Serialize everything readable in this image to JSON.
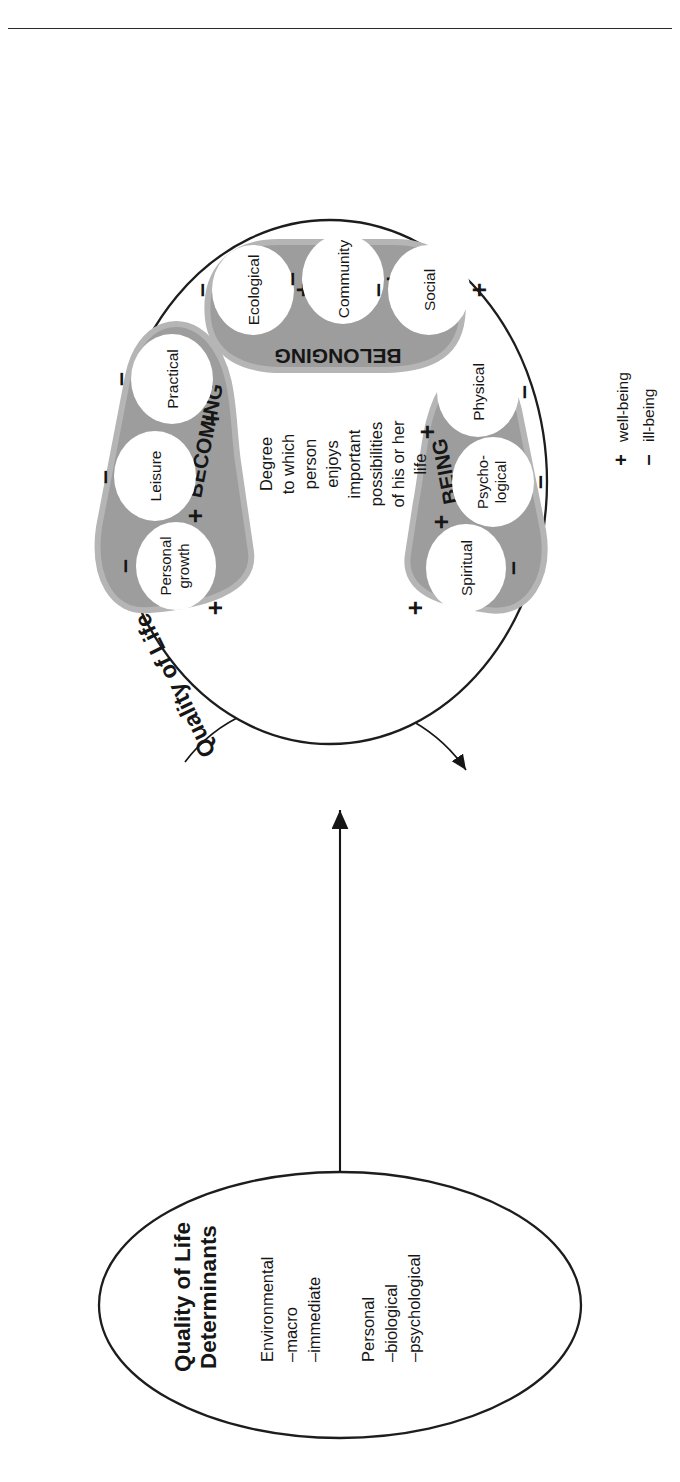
{
  "figure": {
    "rule_present": true,
    "qol_circle": {
      "title": "Quality of Life",
      "center_text": [
        "Degree",
        "to which",
        "person",
        "enjoys",
        "important",
        "possibilities",
        "of his or her",
        "life"
      ],
      "center_text_joined": "Degree to which person enjoys important possibilities of his or her life",
      "domains": [
        {
          "name": "BEING",
          "subdomains": [
            {
              "label": "Physical",
              "well_being": "+",
              "ill_being": "–"
            },
            {
              "label": "Psycho-logical",
              "label_lines": [
                "Psycho-",
                "logical"
              ],
              "well_being": "+",
              "ill_being": "–"
            },
            {
              "label": "Spiritual",
              "well_being": "+",
              "ill_being": "–"
            }
          ]
        },
        {
          "name": "BELONGING",
          "subdomains": [
            {
              "label": "Social",
              "well_being": "+",
              "ill_being": "–"
            },
            {
              "label": "Community",
              "well_being": "+",
              "ill_being": "–"
            },
            {
              "label": "Ecological",
              "well_being": "+",
              "ill_being": "–"
            }
          ]
        },
        {
          "name": "BECOMING",
          "subdomains": [
            {
              "label": "Practical",
              "well_being": "+",
              "ill_being": "–"
            },
            {
              "label": "Leisure",
              "well_being": "+",
              "ill_being": "–"
            },
            {
              "label": "Personal growth",
              "label_lines": [
                "Personal",
                "growth"
              ],
              "well_being": "+",
              "ill_being": "–"
            }
          ]
        }
      ]
    },
    "determinants_circle": {
      "title_lines": [
        "Quality of Life",
        "Determinants"
      ],
      "title": "Quality of Life Determinants",
      "groups": [
        {
          "heading": "Environmental",
          "items": [
            "–macro",
            "–immediate"
          ]
        },
        {
          "heading": "Personal",
          "items": [
            "–biological",
            "–psychological"
          ]
        }
      ]
    },
    "connector": {
      "up_arrow_label": "",
      "feedback_label": "Feedback loop"
    },
    "legend": {
      "items": [
        {
          "symbol": "+",
          "label": "well-being"
        },
        {
          "symbol": "–",
          "label": "ill-being"
        }
      ]
    },
    "colors": {
      "lobe_fill": "#9d9d9d",
      "lobe_stroke": "#b5b5b5",
      "ink": "#161616",
      "outline": "#1d1d1d",
      "bg": "#ffffff"
    }
  }
}
